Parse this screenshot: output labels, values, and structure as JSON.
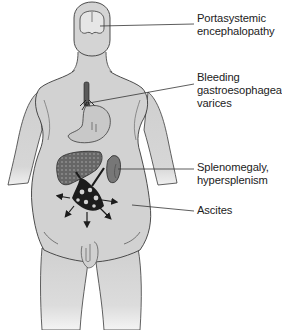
{
  "figure": {
    "colors": {
      "skin": "#d2d2d2",
      "skin_shadow": "#bdbdbd",
      "outline": "#3a3a3a",
      "liver": "#6b6b6b",
      "spleen": "#777777",
      "vessels": "#1c1c1c",
      "stomach": "#c4c4c4",
      "text": "#222222",
      "leader_line": "#333333"
    },
    "labels": [
      {
        "id": "pse",
        "lines": [
          "Portasystemic",
          "encephalopathy"
        ],
        "points_to": "brain"
      },
      {
        "id": "varices",
        "lines": [
          "Bleeding",
          "gastroesophageal",
          "varices"
        ],
        "points_to": "esophagus"
      },
      {
        "id": "spleen",
        "lines": [
          "Splenomegaly,",
          "hypersplenism"
        ],
        "points_to": "spleen"
      },
      {
        "id": "ascites",
        "lines": [
          "Ascites"
        ],
        "points_to": "abdomen"
      }
    ]
  }
}
